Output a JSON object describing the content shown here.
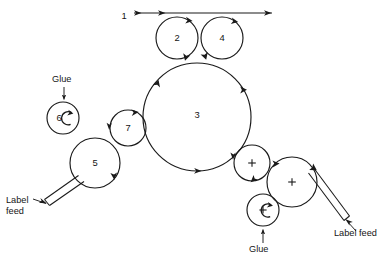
{
  "diagram": {
    "background_color": "#ffffff",
    "ink_color": "#1a1a1a",
    "width": 392,
    "height": 260,
    "rollers": [
      {
        "id": "roller-1",
        "label": "1",
        "kind": "web-line",
        "cx": 124,
        "cy": 14,
        "r": 0,
        "center_mark": "none",
        "spin_arc": false
      },
      {
        "id": "roller-2",
        "label": "2",
        "kind": "circle",
        "cx": 177,
        "cy": 38,
        "r": 21,
        "center_mark": "none",
        "spin_arc": false
      },
      {
        "id": "roller-4",
        "label": "4",
        "kind": "circle",
        "cx": 222,
        "cy": 38,
        "r": 21,
        "center_mark": "none",
        "spin_arc": false
      },
      {
        "id": "roller-3",
        "label": "3",
        "kind": "circle",
        "cx": 197,
        "cy": 117,
        "r": 54,
        "center_mark": "none",
        "spin_arc": false
      },
      {
        "id": "roller-7",
        "label": "7",
        "kind": "circle",
        "cx": 128,
        "cy": 128,
        "r": 18,
        "center_mark": "none",
        "spin_arc": false
      },
      {
        "id": "roller-5",
        "label": "5",
        "kind": "circle",
        "cx": 95,
        "cy": 163,
        "r": 25,
        "center_mark": "none",
        "spin_arc": false
      },
      {
        "id": "roller-6",
        "label": "6",
        "kind": "circle",
        "cx": 63,
        "cy": 118,
        "r": 16,
        "center_mark": "none",
        "spin_arc": true
      },
      {
        "id": "roller-right-upper",
        "label": "",
        "kind": "circle",
        "cx": 252,
        "cy": 163,
        "r": 18,
        "center_mark": "plus",
        "spin_arc": false
      },
      {
        "id": "roller-right-lower",
        "label": "",
        "kind": "circle",
        "cx": 292,
        "cy": 182,
        "r": 25,
        "center_mark": "plus",
        "spin_arc": false
      },
      {
        "id": "roller-glue-right",
        "label": "",
        "kind": "circle",
        "cx": 263,
        "cy": 210,
        "r": 16,
        "center_mark": "plus",
        "spin_arc": true
      }
    ],
    "annotations": [
      {
        "id": "glue-left",
        "text": "Glue",
        "x": 52,
        "y": 82,
        "arrow": "down"
      },
      {
        "id": "glue-right",
        "text": "Glue",
        "x": 249,
        "y": 252,
        "arrow": "up"
      },
      {
        "id": "label-feed-left-line1",
        "text": "Label",
        "x": 6,
        "y": 203,
        "arrow": "up-right"
      },
      {
        "id": "label-feed-left-line2",
        "text": "feed",
        "x": 6,
        "y": 214,
        "arrow": "none"
      },
      {
        "id": "label-feed-right",
        "text": "Label feed",
        "x": 334,
        "y": 236,
        "arrow": "up-left"
      }
    ],
    "web_line": {
      "label": "1",
      "label_x": 124,
      "label_y": 17,
      "y": 13,
      "x_start": 134,
      "x_end": 272,
      "arrow_mid_x": 156,
      "arrow_end_x": 272
    }
  }
}
